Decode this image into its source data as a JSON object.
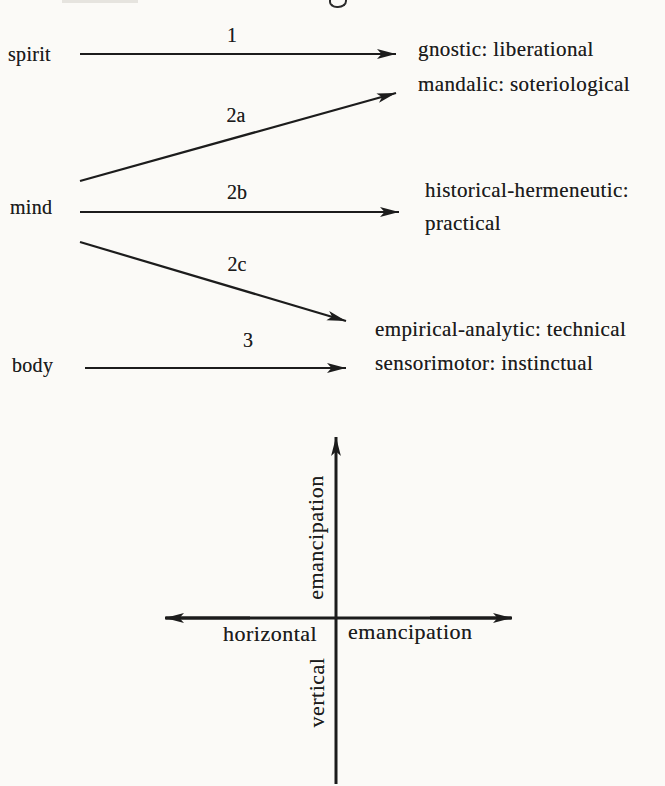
{
  "page": {
    "bg_color": "#fbfaf7",
    "ink_color": "#1c1c1c"
  },
  "mapping_diagram": {
    "sources": {
      "spirit": "spirit",
      "mind": "mind",
      "body": "body"
    },
    "arrow_labels": {
      "a1": "1",
      "a2a": "2a",
      "a2b": "2b",
      "a2c": "2c",
      "a3": "3"
    },
    "targets": {
      "gnostic": "gnostic: liberational",
      "mandalic": "mandalic: soteriological",
      "historical_line1": "historical-hermeneutic:",
      "historical_line2": "practical",
      "empirical": "empirical-analytic: technical",
      "sensorimotor": "sensorimotor: instinctual"
    }
  },
  "cross_diagram": {
    "vertical_axis_upper_word": "emancipation",
    "vertical_axis_lower_word": "vertical",
    "horizontal_axis_left_word": "horizontal",
    "horizontal_axis_right_word": "emancipation"
  }
}
